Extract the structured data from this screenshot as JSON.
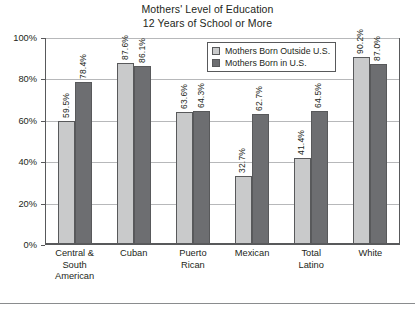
{
  "chart_data": {
    "type": "bar",
    "title": "Mothers' Level of Education",
    "subtitle": "12 Years of School or More",
    "xlabel": "",
    "ylabel": "",
    "ylim": [
      0,
      100
    ],
    "ytick_labels": [
      "0%",
      "20%",
      "40%",
      "60%",
      "80%",
      "100%"
    ],
    "ytick_values": [
      0,
      20,
      40,
      60,
      80,
      100
    ],
    "grid": true,
    "legend_position": "top-right-inside",
    "categories": [
      "Central & South American",
      "Cuban",
      "Puerto Rican",
      "Mexican",
      "Total Latino",
      "White"
    ],
    "category_lines": [
      [
        "Central &",
        "South",
        "American"
      ],
      [
        "Cuban"
      ],
      [
        "Puerto",
        "Rican"
      ],
      [
        "Mexican"
      ],
      [
        "Total",
        "Latino"
      ],
      [
        "White"
      ]
    ],
    "series": [
      {
        "name": "Mothers Born Outside U.S.",
        "color": "#c9cacb",
        "values": [
          59.5,
          87.6,
          63.6,
          32.7,
          41.4,
          90.2
        ],
        "labels": [
          "59.5%",
          "87.6%",
          "63.6%",
          "32.7%",
          "41.4%",
          "90.2%"
        ]
      },
      {
        "name": "Mothers Born in U.S.",
        "color": "#6d6e71",
        "values": [
          78.4,
          86.1,
          64.3,
          62.7,
          64.5,
          87.0
        ],
        "labels": [
          "78.4%",
          "86.1%",
          "64.3%",
          "62.7%",
          "64.5%",
          "87.0%"
        ]
      }
    ]
  },
  "legend": {
    "items": [
      {
        "label": "Mothers Born Outside U.S.",
        "color": "#c9cacb"
      },
      {
        "label": "Mothers Born in U.S.",
        "color": "#6d6e71"
      }
    ]
  }
}
